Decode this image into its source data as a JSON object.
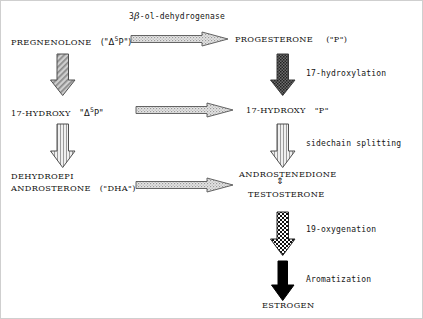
{
  "diagram": {
    "nodes": [
      {
        "id": "pregnenolone",
        "name": "PREGNENOLONE",
        "abbrev": "(\"Δ5P\")",
        "abbrev_base": "(\"Δ",
        "abbrev_sup": "5",
        "abbrev_tail": "P\")"
      },
      {
        "id": "progesterone",
        "name": "PROGESTERONE",
        "abbrev": "(\"P\")"
      },
      {
        "id": "17-hydroxy-delta5p",
        "name": "17-HYDROXY",
        "abbrev_base": "\"Δ",
        "abbrev_sup": "5",
        "abbrev_tail": "P\""
      },
      {
        "id": "17-hydroxy-p",
        "name": "17-HYDROXY",
        "abbrev": "\"P\""
      },
      {
        "id": "dehydroepiandrosterone",
        "line1": "DEHYDROEPI",
        "line2": "ANDROSTERONE",
        "abbrev": "(\"DHA\")"
      },
      {
        "id": "androstenedione",
        "name": "ANDROSTENEDIONE"
      },
      {
        "id": "testosterone",
        "name": "TESTOSTERONE"
      },
      {
        "id": "estrogen",
        "name": "ESTROGEN"
      }
    ],
    "enzymes": [
      {
        "id": "3b-ol-dehydrogenase",
        "prefix": "3",
        "greek": "β",
        "suffix": "-ol-dehydrogenase"
      },
      {
        "id": "17-hydroxylation",
        "label": "17-hydroxylation"
      },
      {
        "id": "sidechain-splitting",
        "label": "sidechain splitting"
      },
      {
        "id": "19-oxygenation",
        "label": "19-oxygenation"
      },
      {
        "id": "aromatization",
        "label": "Aromatization"
      }
    ],
    "equilibrium_symbol": "⇕",
    "colors": {
      "ink": "#111111",
      "arrow_outline": "#4a4a4a",
      "arrow_fill_light": "#d9d9d9",
      "arrow_fill_dark": "#000000"
    }
  }
}
